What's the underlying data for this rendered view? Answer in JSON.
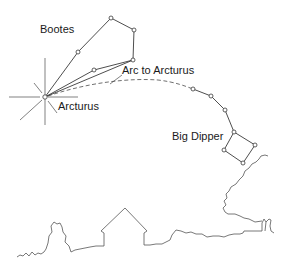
{
  "diagram": {
    "labels": {
      "bootes": "Bootes",
      "arc": "Arc to Arcturus",
      "arcturus": "Arcturus",
      "big_dipper": "Big Dipper"
    },
    "constellations": [
      {
        "name": "Bootes",
        "stars": 6
      },
      {
        "name": "Big Dipper",
        "stars": 7
      }
    ],
    "bright_star": "Arcturus",
    "scenery": [
      "treeline",
      "house"
    ],
    "colors": {
      "line": "#3a3a3a",
      "background": "#ffffff",
      "text": "#1a1a1a"
    }
  }
}
